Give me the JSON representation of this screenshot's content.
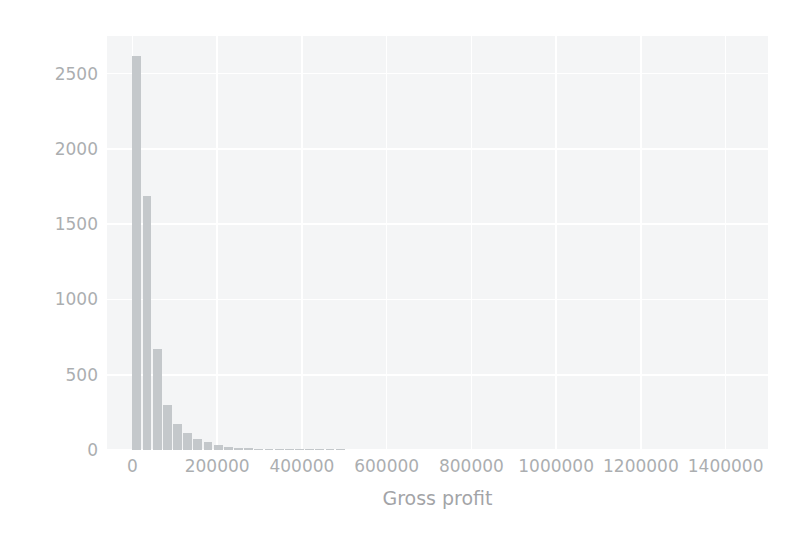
{
  "chart_data": {
    "type": "bar",
    "title": "",
    "subtitle": "",
    "xlabel": "Gross profit",
    "ylabel": "",
    "xlim": [
      -60000,
      1500000
    ],
    "ylim": [
      0,
      2750
    ],
    "grid": true,
    "legend": null,
    "xticks": [
      {
        "value": 0,
        "label": "0"
      },
      {
        "value": 200000,
        "label": "200000"
      },
      {
        "value": 400000,
        "label": "400000"
      },
      {
        "value": 600000,
        "label": "600000"
      },
      {
        "value": 800000,
        "label": "800000"
      },
      {
        "value": 1000000,
        "label": "1000000"
      },
      {
        "value": 1200000,
        "label": "1200000"
      },
      {
        "value": 1400000,
        "label": "1400000"
      }
    ],
    "yticks": [
      {
        "value": 0,
        "label": "0"
      },
      {
        "value": 500,
        "label": "500"
      },
      {
        "value": 1000,
        "label": "1000"
      },
      {
        "value": 1500,
        "label": "1500"
      },
      {
        "value": 2000,
        "label": "2000"
      },
      {
        "value": 2500,
        "label": "2500"
      }
    ],
    "bin_width": 24000,
    "categories": [
      "0",
      "24000",
      "48000",
      "72000",
      "96000",
      "120000",
      "144000",
      "168000",
      "192000",
      "216000",
      "240000",
      "264000",
      "288000",
      "312000",
      "336000",
      "360000",
      "384000",
      "408000",
      "432000",
      "456000",
      "480000"
    ],
    "values": [
      2620,
      1690,
      670,
      300,
      170,
      110,
      75,
      50,
      32,
      22,
      16,
      12,
      9,
      7,
      6,
      5,
      4,
      3,
      3,
      2,
      2
    ],
    "bar_color": "#9aa0a6",
    "plot_background": "#eceef0",
    "grid_color": "#ffffff",
    "tick_label_color": "#6f7478",
    "axis_label_color": "#5f6368"
  }
}
